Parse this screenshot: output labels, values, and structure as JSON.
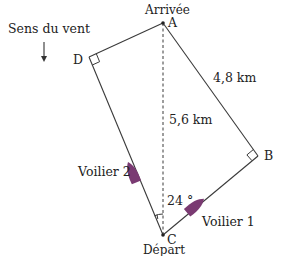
{
  "diagram": {
    "wind": {
      "label": "Sens du vent",
      "icon": "arrow-down-icon"
    },
    "points": {
      "A": {
        "name": "A",
        "caption": "Arrivée",
        "x": 163,
        "y": 23
      },
      "B": {
        "name": "B",
        "x": 258,
        "y": 156
      },
      "C": {
        "name": "C",
        "caption": "Départ",
        "x": 163,
        "y": 235
      },
      "D": {
        "name": "D",
        "x": 89,
        "y": 57
      }
    },
    "measures": {
      "AB": "4,8 km",
      "AC": "5,6 km",
      "angle": "24 °"
    },
    "boats": {
      "boat1": {
        "label": "Voilier 1"
      },
      "boat2": {
        "label": "Voilier 2"
      }
    },
    "colors": {
      "line": "#3a3a3a",
      "boat": "#7a3a72"
    }
  }
}
